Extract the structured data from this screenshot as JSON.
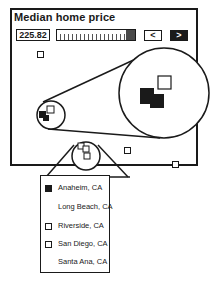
{
  "header": {
    "title": "Median home price",
    "value": "225.82"
  },
  "controls": {
    "prev_label": "<",
    "next_label": ">",
    "slider_position_pct": 100
  },
  "legend": {
    "items": [
      {
        "label": "Anaheim, CA",
        "marker": "filled"
      },
      {
        "label": "Long Beach, CA",
        "marker": "none"
      },
      {
        "label": "Riverside, CA",
        "marker": "hollow"
      },
      {
        "label": "San Diego, CA",
        "marker": "hollow"
      },
      {
        "label": "Santa Ana, CA",
        "marker": "none"
      }
    ]
  },
  "colors": {
    "ink": "#1a1a1a",
    "background": "#ffffff"
  }
}
